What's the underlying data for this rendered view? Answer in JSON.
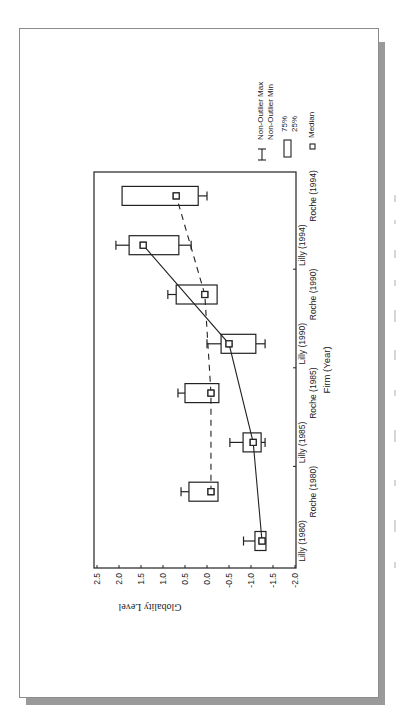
{
  "chart_data": {
    "type": "box",
    "orientation": "page rotated 90 degrees clockwise (landscape figure)",
    "title": "",
    "xlabel": "Firm (Year)",
    "ylabel": "Globality Level",
    "ylim": [
      -2.0,
      2.5
    ],
    "yticks": [
      "2.5",
      "2.0",
      "1.5",
      "1.0",
      "0.5",
      "0.0",
      "-0.5",
      "-1.0",
      "-1.5",
      "-2.0"
    ],
    "categories": [
      "Lilly (1980)",
      "Roche (1980)",
      "Lilly (1985)",
      "Roche (1985)",
      "Lilly (1990)",
      "Roche (1990)",
      "Lilly (1994)",
      "Roche (1994)"
    ],
    "series": [
      {
        "name": "Lilly",
        "line_style": "solid",
        "categories": [
          "Lilly (1980)",
          "Lilly (1985)",
          "Lilly (1990)",
          "Lilly (1994)"
        ],
        "boxes": [
          {
            "cat_index": 0,
            "max": -0.83,
            "q3": -1.09,
            "median": -1.25,
            "q1": -1.34,
            "min": -1.36
          },
          {
            "cat_index": 2,
            "max": -0.52,
            "q3": -0.82,
            "median": -1.05,
            "q1": -1.23,
            "min": -1.32
          },
          {
            "cat_index": 4,
            "max": 0.0,
            "q3": -0.32,
            "median": -0.5,
            "q1": -1.11,
            "min": -1.32
          },
          {
            "cat_index": 6,
            "max": 2.07,
            "q3": 1.77,
            "median": 1.45,
            "q1": 0.64,
            "min": 0.36
          }
        ]
      },
      {
        "name": "Roche",
        "line_style": "dashed",
        "categories": [
          "Roche (1980)",
          "Roche (1985)",
          "Roche (1990)",
          "Roche (1994)"
        ],
        "boxes": [
          {
            "cat_index": 1,
            "max": 0.59,
            "q3": 0.41,
            "median": -0.09,
            "q1": -0.25,
            "min": -0.27
          },
          {
            "cat_index": 3,
            "max": 0.66,
            "q3": 0.5,
            "median": -0.09,
            "q1": -0.27,
            "min": -0.29
          },
          {
            "cat_index": 5,
            "max": 0.89,
            "q3": 0.7,
            "median": 0.05,
            "q1": -0.23,
            "min": -0.25
          },
          {
            "cat_index": 7,
            "max": 1.95,
            "q3": 1.93,
            "median": 0.7,
            "q1": 0.2,
            "min": 0.0
          }
        ]
      }
    ],
    "legend": [
      {
        "symbol": "whisker",
        "labels": [
          "Non-Outlier Max",
          "Non-Outlier Min"
        ]
      },
      {
        "symbol": "box",
        "labels": [
          "75%",
          "25%"
        ]
      },
      {
        "symbol": "square",
        "labels": [
          "Median"
        ]
      }
    ],
    "grid": false,
    "legend_position": "top (right of plot in landscape orientation)"
  },
  "colors": {
    "ink": "#222222",
    "page_border": "#8c8c8c",
    "shadow": "#9a9a9a"
  }
}
